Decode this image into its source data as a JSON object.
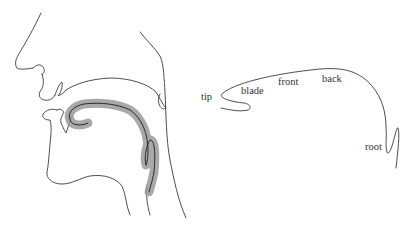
{
  "figure": {
    "left_panel": {
      "name": "vocal-tract-section",
      "highlight_color": "#9a9a9a",
      "line_color": "#3a3a3a"
    },
    "right_panel": {
      "name": "tongue-regions",
      "labels": {
        "tip": "tip",
        "blade": "blade",
        "front": "front",
        "back": "back",
        "root": "root"
      }
    }
  }
}
